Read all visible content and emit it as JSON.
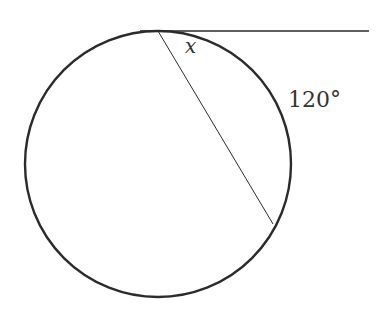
{
  "diagram": {
    "type": "circle-tangent-chord",
    "labels": {
      "angle": "x",
      "arc": "120°"
    },
    "circle": {
      "cx": 158,
      "cy": 164,
      "r": 133
    },
    "tangent_line": {
      "x1": 140,
      "y1": 31,
      "x2": 369,
      "y2": 31
    },
    "chord": {
      "x1": 158,
      "y1": 31,
      "x2": 273,
      "y2": 224
    },
    "colors": {
      "stroke": "#2b2b2b",
      "text": "#333333",
      "background": "#ffffff"
    }
  }
}
